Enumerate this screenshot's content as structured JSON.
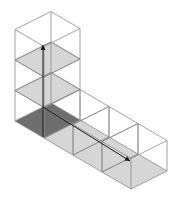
{
  "diagram": {
    "colors": {
      "line": "#8a8a8a",
      "arrow": "#1a1a1a",
      "base_cell": "#6e6e6e",
      "shaded_cell": "#d6d6d6",
      "background": "#ffffff"
    },
    "geometry": {
      "origin_back": [
        51,
        103
      ],
      "vec_left": [
        -36,
        18
      ],
      "vec_right": [
        29,
        17
      ],
      "cube_height": 30.5,
      "column_cubes": 3,
      "row_cubes": 3
    },
    "shaded_slices": [
      "column-level-1",
      "column-level-2"
    ],
    "arrows": [
      {
        "name": "vertical-arrow",
        "from": [
          43,
          137
        ],
        "to": [
          43,
          45
        ]
      },
      {
        "name": "horizontal-arrow",
        "from": [
          43,
          107
        ],
        "to": [
          130,
          161
        ]
      }
    ]
  }
}
